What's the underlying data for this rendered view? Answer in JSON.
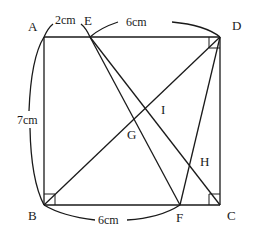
{
  "diagram": {
    "type": "geometry",
    "shape": "rectangle ABCD with interior segments",
    "points": {
      "A": {
        "label": "A",
        "x": 44,
        "y": 37
      },
      "D": {
        "label": "D",
        "x": 220,
        "y": 37
      },
      "B": {
        "label": "B",
        "x": 44,
        "y": 205
      },
      "C": {
        "label": "C",
        "x": 220,
        "y": 205
      },
      "E": {
        "label": "E",
        "x": 90,
        "y": 37
      },
      "F": {
        "label": "F",
        "x": 180,
        "y": 205
      },
      "G": {
        "label": "G"
      },
      "H": {
        "label": "H"
      },
      "I": {
        "label": "I"
      }
    },
    "segments": [
      "AD",
      "DC",
      "CB",
      "BA",
      "BD",
      "EC",
      "EF",
      "FD"
    ],
    "right_angles": [
      "B",
      "C",
      "D"
    ],
    "dimensions": {
      "AE": "2cm",
      "ED": "6cm",
      "AB": "7cm",
      "BF": "6cm"
    }
  }
}
